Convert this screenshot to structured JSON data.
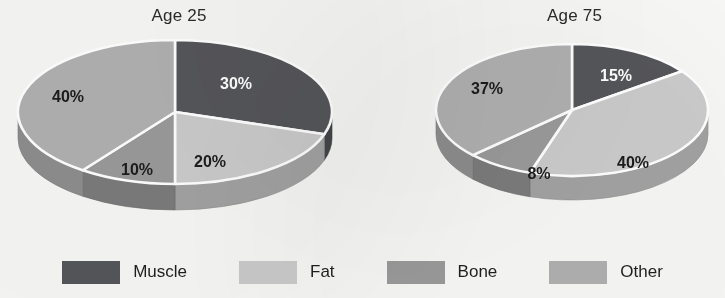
{
  "figure": {
    "ghost_artifact": "",
    "background_color": "#f7f7f5"
  },
  "colors": {
    "muscle": "#55565a",
    "fat": "#cbcbcb",
    "bone": "#9a9a9a",
    "other": "#b0b0b0",
    "muscle_side": "#3e3f42",
    "fat_side": "#a5a5a5",
    "bone_side": "#7d7d7d",
    "other_side": "#8f8f8f",
    "separator": "#ffffff",
    "label_dark": "#1c1c1c",
    "label_light": "#ffffff"
  },
  "legend": {
    "items": [
      {
        "label": "Muscle",
        "color": "#55565a"
      },
      {
        "label": "Fat",
        "color": "#cbcbcb"
      },
      {
        "label": "Bone",
        "color": "#9a9a9a"
      },
      {
        "label": "Other",
        "color": "#b0b0b0"
      }
    ]
  },
  "chart_data": [
    {
      "type": "pie",
      "title": "Age 25",
      "labels": [
        "Muscle",
        "Fat",
        "Bone",
        "Other"
      ],
      "values": [
        30,
        20,
        10,
        40
      ],
      "value_labels": [
        "30%",
        "20%",
        "10%",
        "40%"
      ],
      "colors": [
        "#55565a",
        "#cbcbcb",
        "#9a9a9a",
        "#b0b0b0"
      ],
      "label_colors": [
        "#ffffff",
        "#1c1c1c",
        "#1c1c1c",
        "#1c1c1c"
      ],
      "start_angle_deg": 0,
      "direction": "clockwise",
      "three_d": true,
      "legend_position": "bottom"
    },
    {
      "type": "pie",
      "title": "Age 75",
      "labels": [
        "Muscle",
        "Fat",
        "Bone",
        "Other"
      ],
      "values": [
        15,
        40,
        8,
        37
      ],
      "value_labels": [
        "15%",
        "40%",
        "8%",
        "37%"
      ],
      "colors": [
        "#55565a",
        "#cbcbcb",
        "#9a9a9a",
        "#b0b0b0"
      ],
      "label_colors": [
        "#ffffff",
        "#1c1c1c",
        "#1c1c1c",
        "#1c1c1c"
      ],
      "start_angle_deg": 0,
      "direction": "clockwise",
      "three_d": true,
      "legend_position": "bottom"
    }
  ]
}
